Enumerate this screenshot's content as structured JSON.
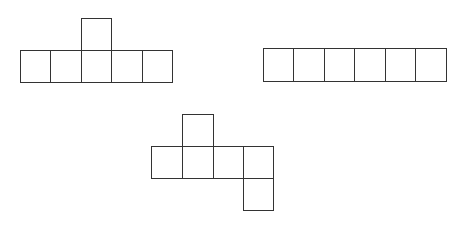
{
  "diagram": {
    "stroke_color": "#333333",
    "figures": [
      {
        "name": "net-a",
        "squares": [
          {
            "x": 81,
            "y": 18,
            "w": 31,
            "h": 33
          },
          {
            "x": 20,
            "y": 50,
            "w": 31,
            "h": 33
          },
          {
            "x": 50,
            "y": 50,
            "w": 32,
            "h": 33
          },
          {
            "x": 81,
            "y": 50,
            "w": 31,
            "h": 33
          },
          {
            "x": 111,
            "y": 50,
            "w": 32,
            "h": 33
          },
          {
            "x": 142,
            "y": 50,
            "w": 31,
            "h": 33
          }
        ]
      },
      {
        "name": "net-b",
        "squares": [
          {
            "x": 263,
            "y": 48,
            "w": 31,
            "h": 34
          },
          {
            "x": 293,
            "y": 48,
            "w": 32,
            "h": 34
          },
          {
            "x": 324,
            "y": 48,
            "w": 31,
            "h": 34
          },
          {
            "x": 354,
            "y": 48,
            "w": 32,
            "h": 34
          },
          {
            "x": 385,
            "y": 48,
            "w": 31,
            "h": 34
          },
          {
            "x": 415,
            "y": 48,
            "w": 32,
            "h": 34
          }
        ]
      },
      {
        "name": "net-c",
        "squares": [
          {
            "x": 182,
            "y": 114,
            "w": 32,
            "h": 33
          },
          {
            "x": 151,
            "y": 146,
            "w": 32,
            "h": 33
          },
          {
            "x": 182,
            "y": 146,
            "w": 32,
            "h": 33
          },
          {
            "x": 213,
            "y": 146,
            "w": 31,
            "h": 33
          },
          {
            "x": 243,
            "y": 146,
            "w": 31,
            "h": 33
          },
          {
            "x": 243,
            "y": 178,
            "w": 31,
            "h": 33
          }
        ]
      }
    ]
  }
}
